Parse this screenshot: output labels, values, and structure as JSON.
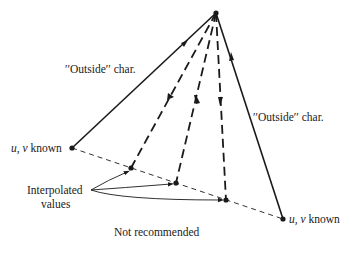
{
  "diagram": {
    "caption": "Not recommended",
    "labels": {
      "outside_left": "′′Outside′′ char.",
      "outside_right": "′′Outside′′ char.",
      "known_left_vars": "u, v",
      "known_left_word": " known",
      "known_right_vars": "u, v",
      "known_right_word": " known",
      "interpolated_line1": "Interpolated",
      "interpolated_line2": "values"
    },
    "nodes": [
      {
        "id": "apex",
        "role": "solution point"
      },
      {
        "id": "known-left",
        "role": "known u,v"
      },
      {
        "id": "interp-1",
        "role": "interpolated value"
      },
      {
        "id": "interp-2",
        "role": "interpolated value"
      },
      {
        "id": "interp-3",
        "role": "interpolated value"
      },
      {
        "id": "known-right",
        "role": "known u,v"
      }
    ],
    "edges": [
      {
        "from": "known-left",
        "to": "apex",
        "style": "solid",
        "label": "Outside char."
      },
      {
        "from": "known-right",
        "to": "apex",
        "style": "solid",
        "label": "Outside char."
      },
      {
        "from": "apex",
        "to": "interp-1",
        "style": "dashed"
      },
      {
        "from": "apex",
        "to": "interp-2",
        "style": "dashed"
      },
      {
        "from": "apex",
        "to": "interp-3",
        "style": "dashed"
      },
      {
        "from": "known-left",
        "to": "known-right",
        "style": "thin-dashed"
      }
    ],
    "colors": {
      "ink": "#1a1a1a",
      "background": "#ffffff"
    }
  }
}
